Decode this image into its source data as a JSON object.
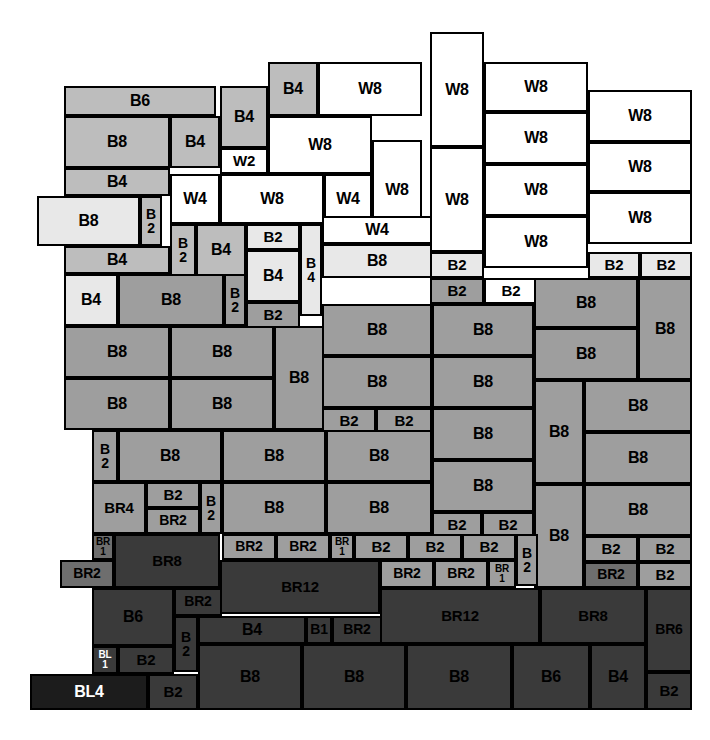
{
  "diagram": {
    "canvas": {
      "width": 710,
      "height": 740,
      "background": "#ffffff"
    },
    "legend_colors": {
      "window_white": "#ffffff",
      "brick_very_light": "#e8e8e8",
      "brick_light": "#bdbdbd",
      "brick_mid": "#9e9e9e",
      "brick_dark": "#6e6e6e",
      "brick_darker": "#3a3a3a",
      "block_black": "#1c1c1c",
      "outline": "#000000"
    },
    "unit_types": [
      "W2",
      "W4",
      "W8",
      "B1",
      "B2",
      "B4",
      "B6",
      "B8",
      "BR1",
      "BR2",
      "BR4",
      "BR6",
      "BR8",
      "BR12",
      "BL1",
      "BL4"
    ],
    "blocks": [
      {
        "label": "B6",
        "x": 64,
        "y": 86,
        "w": 152,
        "h": 30,
        "mat": "B2",
        "fs": "fs16"
      },
      {
        "label": "B8",
        "x": 64,
        "y": 116,
        "w": 106,
        "h": 52,
        "mat": "B2",
        "fs": "fs16"
      },
      {
        "label": "B4",
        "x": 170,
        "y": 116,
        "w": 50,
        "h": 52,
        "mat": "B2",
        "fs": "fs16"
      },
      {
        "label": "B4",
        "x": 64,
        "y": 168,
        "w": 106,
        "h": 28,
        "mat": "B2",
        "fs": "fs16"
      },
      {
        "label": "B8",
        "x": 37,
        "y": 196,
        "w": 103,
        "h": 50,
        "mat": "B1",
        "fs": "fs16"
      },
      {
        "label": "B\n2",
        "x": 140,
        "y": 196,
        "w": 22,
        "h": 50,
        "mat": "B2",
        "fs": "fs14"
      },
      {
        "label": "B4",
        "x": 64,
        "y": 246,
        "w": 106,
        "h": 28,
        "mat": "B2",
        "fs": "fs16"
      },
      {
        "label": "B4",
        "x": 220,
        "y": 86,
        "w": 48,
        "h": 62,
        "mat": "B2",
        "fs": "fs16"
      },
      {
        "label": "W2",
        "x": 220,
        "y": 148,
        "w": 48,
        "h": 26,
        "mat": "W",
        "fs": "fs15"
      },
      {
        "label": "B4",
        "x": 268,
        "y": 62,
        "w": 50,
        "h": 54,
        "mat": "B2",
        "fs": "fs16"
      },
      {
        "label": "W8",
        "x": 318,
        "y": 62,
        "w": 104,
        "h": 54,
        "mat": "W",
        "fs": "fs16"
      },
      {
        "label": "W8",
        "x": 268,
        "y": 116,
        "w": 104,
        "h": 58,
        "mat": "W",
        "fs": "fs16"
      },
      {
        "label": "W8",
        "x": 372,
        "y": 140,
        "w": 50,
        "h": 100,
        "mat": "W",
        "fs": "fs16"
      },
      {
        "label": "W4",
        "x": 170,
        "y": 174,
        "w": 50,
        "h": 50,
        "mat": "W",
        "fs": "fs16"
      },
      {
        "label": "W8",
        "x": 220,
        "y": 174,
        "w": 104,
        "h": 50,
        "mat": "W",
        "fs": "fs16"
      },
      {
        "label": "W4",
        "x": 324,
        "y": 174,
        "w": 48,
        "h": 50,
        "mat": "W",
        "fs": "fs16"
      },
      {
        "label": "B\n2",
        "x": 170,
        "y": 224,
        "w": 26,
        "h": 52,
        "mat": "B2",
        "fs": "fs14"
      },
      {
        "label": "B4",
        "x": 196,
        "y": 224,
        "w": 50,
        "h": 52,
        "mat": "B2",
        "fs": "fs16"
      },
      {
        "label": "B2",
        "x": 246,
        "y": 224,
        "w": 54,
        "h": 26,
        "mat": "B1",
        "fs": "fs15"
      },
      {
        "label": "B4",
        "x": 246,
        "y": 250,
        "w": 54,
        "h": 52,
        "mat": "B1",
        "fs": "fs16"
      },
      {
        "label": "B\n4",
        "x": 300,
        "y": 224,
        "w": 22,
        "h": 92,
        "mat": "B1",
        "fs": "fs14"
      },
      {
        "label": "W4",
        "x": 322,
        "y": 216,
        "w": 110,
        "h": 28,
        "mat": "W",
        "fs": "fs16"
      },
      {
        "label": "B8",
        "x": 322,
        "y": 244,
        "w": 110,
        "h": 34,
        "mat": "B1",
        "fs": "fs16"
      },
      {
        "label": "W8",
        "x": 430,
        "y": 32,
        "w": 54,
        "h": 115,
        "mat": "W",
        "fs": "fs16"
      },
      {
        "label": "W8",
        "x": 430,
        "y": 147,
        "w": 54,
        "h": 105,
        "mat": "W",
        "fs": "fs16"
      },
      {
        "label": "B2",
        "x": 430,
        "y": 252,
        "w": 54,
        "h": 26,
        "mat": "B1",
        "fs": "fs15"
      },
      {
        "label": "B2",
        "x": 430,
        "y": 278,
        "w": 54,
        "h": 26,
        "mat": "B3",
        "fs": "fs15"
      },
      {
        "label": "W8",
        "x": 484,
        "y": 62,
        "w": 104,
        "h": 50,
        "mat": "W",
        "fs": "fs16"
      },
      {
        "label": "W8",
        "x": 484,
        "y": 112,
        "w": 104,
        "h": 52,
        "mat": "W",
        "fs": "fs16"
      },
      {
        "label": "W8",
        "x": 484,
        "y": 164,
        "w": 104,
        "h": 52,
        "mat": "W",
        "fs": "fs16"
      },
      {
        "label": "W8",
        "x": 484,
        "y": 216,
        "w": 104,
        "h": 52,
        "mat": "W",
        "fs": "fs16"
      },
      {
        "label": "B2",
        "x": 484,
        "y": 278,
        "w": 54,
        "h": 26,
        "mat": "W",
        "fs": "fs15"
      },
      {
        "label": "W8",
        "x": 588,
        "y": 90,
        "w": 104,
        "h": 52,
        "mat": "W",
        "fs": "fs16"
      },
      {
        "label": "W8",
        "x": 588,
        "y": 142,
        "w": 104,
        "h": 50,
        "mat": "W",
        "fs": "fs16"
      },
      {
        "label": "W8",
        "x": 588,
        "y": 192,
        "w": 104,
        "h": 52,
        "mat": "W",
        "fs": "fs16"
      },
      {
        "label": "B2",
        "x": 588,
        "y": 252,
        "w": 52,
        "h": 26,
        "mat": "B1",
        "fs": "fs15"
      },
      {
        "label": "B2",
        "x": 640,
        "y": 252,
        "w": 52,
        "h": 26,
        "mat": "B1",
        "fs": "fs15"
      },
      {
        "label": "B4",
        "x": 64,
        "y": 274,
        "w": 54,
        "h": 52,
        "mat": "B1",
        "fs": "fs16"
      },
      {
        "label": "B8",
        "x": 118,
        "y": 274,
        "w": 106,
        "h": 52,
        "mat": "B3",
        "fs": "fs16"
      },
      {
        "label": "B\n2",
        "x": 224,
        "y": 274,
        "w": 22,
        "h": 52,
        "mat": "B3",
        "fs": "fs14"
      },
      {
        "label": "B2",
        "x": 246,
        "y": 302,
        "w": 54,
        "h": 26,
        "mat": "B3",
        "fs": "fs15"
      },
      {
        "label": "B8",
        "x": 64,
        "y": 326,
        "w": 106,
        "h": 52,
        "mat": "B3",
        "fs": "fs16"
      },
      {
        "label": "B8",
        "x": 170,
        "y": 326,
        "w": 104,
        "h": 52,
        "mat": "B3",
        "fs": "fs16"
      },
      {
        "label": "B8",
        "x": 64,
        "y": 378,
        "w": 106,
        "h": 52,
        "mat": "B3",
        "fs": "fs16"
      },
      {
        "label": "B8",
        "x": 170,
        "y": 378,
        "w": 104,
        "h": 52,
        "mat": "B3",
        "fs": "fs16"
      },
      {
        "label": "B8",
        "x": 274,
        "y": 326,
        "w": 50,
        "h": 104,
        "mat": "B3",
        "fs": "fs16"
      },
      {
        "label": "B8",
        "x": 322,
        "y": 304,
        "w": 110,
        "h": 52,
        "mat": "B3",
        "fs": "fs16"
      },
      {
        "label": "B8",
        "x": 322,
        "y": 356,
        "w": 110,
        "h": 52,
        "mat": "B3",
        "fs": "fs16"
      },
      {
        "label": "B2",
        "x": 322,
        "y": 408,
        "w": 54,
        "h": 26,
        "mat": "B3",
        "fs": "fs15"
      },
      {
        "label": "B2",
        "x": 376,
        "y": 408,
        "w": 56,
        "h": 26,
        "mat": "B3",
        "fs": "fs15"
      },
      {
        "label": "B8",
        "x": 432,
        "y": 304,
        "w": 102,
        "h": 52,
        "mat": "B3",
        "fs": "fs16"
      },
      {
        "label": "B8",
        "x": 432,
        "y": 356,
        "w": 102,
        "h": 52,
        "mat": "B3",
        "fs": "fs16"
      },
      {
        "label": "B8",
        "x": 432,
        "y": 408,
        "w": 102,
        "h": 52,
        "mat": "B3",
        "fs": "fs16"
      },
      {
        "label": "B8",
        "x": 432,
        "y": 460,
        "w": 102,
        "h": 52,
        "mat": "B3",
        "fs": "fs16"
      },
      {
        "label": "B2",
        "x": 432,
        "y": 512,
        "w": 50,
        "h": 26,
        "mat": "B3",
        "fs": "fs15"
      },
      {
        "label": "B2",
        "x": 482,
        "y": 512,
        "w": 52,
        "h": 26,
        "mat": "B3",
        "fs": "fs15"
      },
      {
        "label": "B8",
        "x": 534,
        "y": 278,
        "w": 104,
        "h": 50,
        "mat": "B3",
        "fs": "fs16"
      },
      {
        "label": "B8",
        "x": 534,
        "y": 328,
        "w": 104,
        "h": 52,
        "mat": "B3",
        "fs": "fs16"
      },
      {
        "label": "B8",
        "x": 638,
        "y": 278,
        "w": 54,
        "h": 102,
        "mat": "B3",
        "fs": "fs16"
      },
      {
        "label": "B8",
        "x": 534,
        "y": 380,
        "w": 50,
        "h": 104,
        "mat": "B3",
        "fs": "fs16"
      },
      {
        "label": "B8",
        "x": 584,
        "y": 380,
        "w": 108,
        "h": 52,
        "mat": "B3",
        "fs": "fs16"
      },
      {
        "label": "B8",
        "x": 584,
        "y": 432,
        "w": 108,
        "h": 52,
        "mat": "B3",
        "fs": "fs16"
      },
      {
        "label": "B8",
        "x": 534,
        "y": 484,
        "w": 50,
        "h": 104,
        "mat": "B3",
        "fs": "fs16"
      },
      {
        "label": "B8",
        "x": 584,
        "y": 484,
        "w": 108,
        "h": 52,
        "mat": "B3",
        "fs": "fs16"
      },
      {
        "label": "B2",
        "x": 584,
        "y": 536,
        "w": 54,
        "h": 26,
        "mat": "B3",
        "fs": "fs15"
      },
      {
        "label": "B2",
        "x": 638,
        "y": 536,
        "w": 54,
        "h": 26,
        "mat": "B3",
        "fs": "fs15"
      },
      {
        "label": "BR2",
        "x": 584,
        "y": 562,
        "w": 54,
        "h": 26,
        "mat": "BR",
        "fs": "fs14"
      },
      {
        "label": "B2",
        "x": 638,
        "y": 562,
        "w": 54,
        "h": 26,
        "mat": "B3",
        "fs": "fs15"
      },
      {
        "label": "B\n2",
        "x": 92,
        "y": 430,
        "w": 26,
        "h": 52,
        "mat": "B3",
        "fs": "fs14"
      },
      {
        "label": "B8",
        "x": 118,
        "y": 430,
        "w": 104,
        "h": 52,
        "mat": "B3",
        "fs": "fs16"
      },
      {
        "label": "B8",
        "x": 222,
        "y": 430,
        "w": 104,
        "h": 52,
        "mat": "B3",
        "fs": "fs16"
      },
      {
        "label": "B8",
        "x": 326,
        "y": 430,
        "w": 106,
        "h": 52,
        "mat": "B3",
        "fs": "fs16"
      },
      {
        "label": "BR4",
        "x": 92,
        "y": 482,
        "w": 54,
        "h": 52,
        "mat": "B3",
        "fs": "fs15"
      },
      {
        "label": "B2",
        "x": 146,
        "y": 482,
        "w": 54,
        "h": 26,
        "mat": "B3",
        "fs": "fs15"
      },
      {
        "label": "BR2",
        "x": 146,
        "y": 508,
        "w": 54,
        "h": 26,
        "mat": "B3",
        "fs": "fs14"
      },
      {
        "label": "B\n2",
        "x": 200,
        "y": 482,
        "w": 22,
        "h": 52,
        "mat": "B3",
        "fs": "fs14"
      },
      {
        "label": "B8",
        "x": 222,
        "y": 482,
        "w": 104,
        "h": 52,
        "mat": "B3",
        "fs": "fs16"
      },
      {
        "label": "B8",
        "x": 326,
        "y": 482,
        "w": 106,
        "h": 52,
        "mat": "B3",
        "fs": "fs16"
      },
      {
        "label": "BR\n1",
        "x": 92,
        "y": 534,
        "w": 22,
        "h": 26,
        "mat": "BR",
        "fs": "fs10"
      },
      {
        "label": "BR2",
        "x": 60,
        "y": 560,
        "w": 54,
        "h": 28,
        "mat": "BR",
        "fs": "fs14"
      },
      {
        "label": "BR8",
        "x": 114,
        "y": 534,
        "w": 106,
        "h": 54,
        "mat": "BRD",
        "fs": "fs15"
      },
      {
        "label": "BR2",
        "x": 222,
        "y": 534,
        "w": 54,
        "h": 26,
        "mat": "B3",
        "fs": "fs14"
      },
      {
        "label": "BR2",
        "x": 276,
        "y": 534,
        "w": 54,
        "h": 26,
        "mat": "B3",
        "fs": "fs14"
      },
      {
        "label": "BR\n1",
        "x": 330,
        "y": 534,
        "w": 24,
        "h": 26,
        "mat": "B3",
        "fs": "fs10"
      },
      {
        "label": "B2",
        "x": 354,
        "y": 534,
        "w": 54,
        "h": 26,
        "mat": "B3",
        "fs": "fs15"
      },
      {
        "label": "B2",
        "x": 408,
        "y": 534,
        "w": 54,
        "h": 26,
        "mat": "B3",
        "fs": "fs15"
      },
      {
        "label": "B2",
        "x": 462,
        "y": 534,
        "w": 54,
        "h": 26,
        "mat": "B3",
        "fs": "fs15"
      },
      {
        "label": "B\n2",
        "x": 516,
        "y": 534,
        "w": 22,
        "h": 52,
        "mat": "B3",
        "fs": "fs14"
      },
      {
        "label": "BR2",
        "x": 380,
        "y": 560,
        "w": 54,
        "h": 28,
        "mat": "B3",
        "fs": "fs14"
      },
      {
        "label": "BR2",
        "x": 434,
        "y": 560,
        "w": 54,
        "h": 28,
        "mat": "B3",
        "fs": "fs14"
      },
      {
        "label": "BR\n1",
        "x": 488,
        "y": 560,
        "w": 28,
        "h": 28,
        "mat": "B3",
        "fs": "fs10"
      },
      {
        "label": "BR12",
        "x": 220,
        "y": 560,
        "w": 160,
        "h": 54,
        "mat": "BRD",
        "fs": "fs15"
      },
      {
        "label": "B6",
        "x": 92,
        "y": 588,
        "w": 82,
        "h": 58,
        "mat": "BRD",
        "fs": "fs16"
      },
      {
        "label": "BR2",
        "x": 174,
        "y": 588,
        "w": 48,
        "h": 28,
        "mat": "BRD",
        "fs": "fs14"
      },
      {
        "label": "B\n2",
        "x": 174,
        "y": 616,
        "w": 24,
        "h": 56,
        "mat": "BRD",
        "fs": "fs14"
      },
      {
        "label": "B4",
        "x": 198,
        "y": 616,
        "w": 108,
        "h": 28,
        "mat": "BRD",
        "fs": "fs16"
      },
      {
        "label": "B1",
        "x": 306,
        "y": 616,
        "w": 26,
        "h": 28,
        "mat": "BRD",
        "fs": "fs14"
      },
      {
        "label": "BR2",
        "x": 332,
        "y": 616,
        "w": 50,
        "h": 28,
        "mat": "BRD",
        "fs": "fs14"
      },
      {
        "label": "BR12",
        "x": 380,
        "y": 588,
        "w": 160,
        "h": 56,
        "mat": "BRD",
        "fs": "fs15"
      },
      {
        "label": "BR8",
        "x": 540,
        "y": 588,
        "w": 106,
        "h": 56,
        "mat": "BRD",
        "fs": "fs15"
      },
      {
        "label": "BR6",
        "x": 646,
        "y": 588,
        "w": 46,
        "h": 84,
        "mat": "BRD",
        "fs": "fs14"
      },
      {
        "label": "B2",
        "x": 646,
        "y": 672,
        "w": 46,
        "h": 38,
        "mat": "BRD",
        "fs": "fs15"
      },
      {
        "label": "BL\n1",
        "x": 92,
        "y": 646,
        "w": 26,
        "h": 28,
        "mat": "BRD",
        "fs": "fs10",
        "white": true
      },
      {
        "label": "B2",
        "x": 118,
        "y": 646,
        "w": 56,
        "h": 28,
        "mat": "BRD",
        "fs": "fs15"
      },
      {
        "label": "BL4",
        "x": 30,
        "y": 674,
        "w": 118,
        "h": 36,
        "mat": "BL",
        "fs": "fs16"
      },
      {
        "label": "B2",
        "x": 148,
        "y": 674,
        "w": 50,
        "h": 36,
        "mat": "BRD",
        "fs": "fs15"
      },
      {
        "label": "B8",
        "x": 198,
        "y": 644,
        "w": 104,
        "h": 66,
        "mat": "BRD",
        "fs": "fs16"
      },
      {
        "label": "B8",
        "x": 302,
        "y": 644,
        "w": 104,
        "h": 66,
        "mat": "BRD",
        "fs": "fs16"
      },
      {
        "label": "B8",
        "x": 406,
        "y": 644,
        "w": 106,
        "h": 66,
        "mat": "BRD",
        "fs": "fs16"
      },
      {
        "label": "B6",
        "x": 512,
        "y": 644,
        "w": 78,
        "h": 66,
        "mat": "BRD",
        "fs": "fs16"
      },
      {
        "label": "B4",
        "x": 590,
        "y": 644,
        "w": 56,
        "h": 66,
        "mat": "BRD",
        "fs": "fs16"
      }
    ]
  }
}
